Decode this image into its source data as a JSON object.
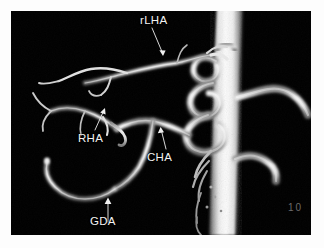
{
  "image": {
    "modality_caption": "3D contrast-enhanced angiographic volume rendering of the hepatic arterial tree",
    "background_color": "#000000",
    "border_color": "#fdfdfd",
    "vessel_color": "#f4f4f4",
    "label_color": "#f2f2f2",
    "panel": {
      "x": 11,
      "y": 11,
      "width": 300,
      "height": 224
    }
  },
  "annotations": [
    {
      "id": "rlha",
      "label": "rLHA",
      "meaning": "replaced left hepatic artery",
      "label_x": 129,
      "label_y": 4,
      "arrow": {
        "x1": 144,
        "y1": 19,
        "x2": 155,
        "y2": 47
      }
    },
    {
      "id": "rha",
      "label": "RHA",
      "meaning": "right hepatic artery",
      "label_x": 67,
      "label_y": 122,
      "arrow": {
        "x1": 92,
        "y1": 120,
        "x2": 81,
        "y2": 98
      }
    },
    {
      "id": "cha",
      "label": "CHA",
      "meaning": "common hepatic artery",
      "label_x": 136,
      "label_y": 141,
      "arrow": {
        "x1": 155,
        "y1": 139,
        "x2": 151,
        "y2": 118
      }
    },
    {
      "id": "gda",
      "label": "GDA",
      "meaning": "gastroduodenal artery",
      "label_x": 79,
      "label_y": 215,
      "arrow": {
        "x1": 97,
        "y1": 212,
        "x2": 97,
        "y2": 188
      }
    }
  ],
  "scale_marker": {
    "text": "10",
    "x": 288,
    "y": 203
  },
  "vessels": {
    "aorta": {
      "name": "abdominal-aorta",
      "description": "bright vertical trunk occupying the right third of the field",
      "center_x_top": 218,
      "center_x_bottom": 208,
      "width_top": 26,
      "width_bottom": 23
    },
    "branch_count": 14,
    "tortuosity": "marked serpentine coiling of the proximal hepatic branches adjacent to the aorta"
  }
}
